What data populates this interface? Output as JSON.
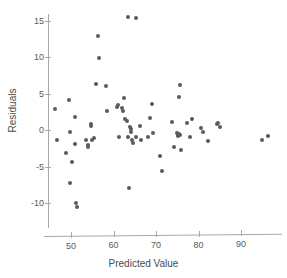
{
  "chart_data": {
    "type": "scatter",
    "title": "",
    "xlabel": "Predicted Value",
    "ylabel": "Residuals",
    "xlim": [
      45,
      98
    ],
    "ylim": [
      -11.5,
      16.5
    ],
    "xticks": [
      50,
      60,
      70,
      80,
      90
    ],
    "yticks": [
      15,
      10,
      5,
      0,
      -5,
      -10
    ],
    "xtick_labels": [
      "50",
      "60",
      "70",
      "80",
      "90"
    ],
    "ytick_labels": [
      "15",
      "10",
      "5",
      "0",
      "-5",
      "-10"
    ],
    "grid": false,
    "legend": null,
    "marker_color": "#5b5b5b",
    "axis_color": "#a8a8a8",
    "points": [
      [
        46.3,
        2.9
      ],
      [
        46.6,
        -1.4
      ],
      [
        48.9,
        -3.1
      ],
      [
        49.6,
        4.1
      ],
      [
        49.7,
        -0.2
      ],
      [
        49.8,
        -7.2
      ],
      [
        50.3,
        -4.3
      ],
      [
        50.9,
        1.8
      ],
      [
        51.0,
        -1.9
      ],
      [
        51.2,
        -10.0
      ],
      [
        51.3,
        -10.6
      ],
      [
        53.5,
        -1.3
      ],
      [
        53.9,
        -2.1
      ],
      [
        54.0,
        -2.3
      ],
      [
        54.6,
        0.9
      ],
      [
        54.7,
        0.6
      ],
      [
        55.0,
        -1.3
      ],
      [
        55.4,
        -1.1
      ],
      [
        55.8,
        6.4
      ],
      [
        56.4,
        12.9
      ],
      [
        56.6,
        9.9
      ],
      [
        58.2,
        6.1
      ],
      [
        58.4,
        2.6
      ],
      [
        60.8,
        3.2
      ],
      [
        61.0,
        3.4
      ],
      [
        61.4,
        -0.9
      ],
      [
        62.1,
        3.1
      ],
      [
        62.3,
        2.6
      ],
      [
        62.5,
        4.4
      ],
      [
        62.8,
        1.6
      ],
      [
        63.2,
        1.2
      ],
      [
        63.4,
        -1.0
      ],
      [
        63.5,
        15.6
      ],
      [
        63.6,
        -7.9
      ],
      [
        63.8,
        0.4
      ],
      [
        64.0,
        0.1
      ],
      [
        64.2,
        -0.3
      ],
      [
        64.3,
        -1.3
      ],
      [
        64.6,
        -1.7
      ],
      [
        65.2,
        15.4
      ],
      [
        65.4,
        -1.0
      ],
      [
        66.3,
        0.6
      ],
      [
        66.5,
        -1.4
      ],
      [
        68.0,
        -1.0
      ],
      [
        68.6,
        1.7
      ],
      [
        69.1,
        3.6
      ],
      [
        69.4,
        -0.4
      ],
      [
        70.9,
        -3.6
      ],
      [
        71.4,
        -5.6
      ],
      [
        73.8,
        1.1
      ],
      [
        74.2,
        -2.3
      ],
      [
        74.9,
        -0.4
      ],
      [
        75.1,
        -0.6
      ],
      [
        75.2,
        -0.8
      ],
      [
        75.3,
        4.6
      ],
      [
        75.4,
        -0.5
      ],
      [
        75.6,
        6.2
      ],
      [
        75.7,
        -0.7
      ],
      [
        75.9,
        -2.7
      ],
      [
        77.3,
        1.0
      ],
      [
        78.0,
        -0.9
      ],
      [
        78.4,
        1.5
      ],
      [
        80.6,
        0.3
      ],
      [
        81.0,
        -0.3
      ],
      [
        82.3,
        -1.5
      ],
      [
        84.3,
        0.9
      ],
      [
        84.7,
        1.0
      ],
      [
        85.1,
        0.4
      ],
      [
        95.0,
        -1.4
      ],
      [
        96.4,
        -0.8
      ]
    ]
  }
}
